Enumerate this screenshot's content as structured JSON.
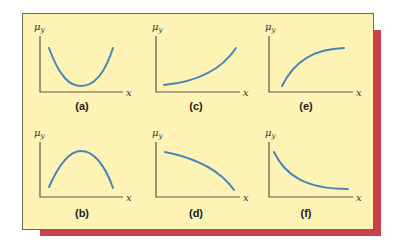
{
  "figure": {
    "panels": [
      {
        "id": "a",
        "label": "(a)",
        "shape": "U-shaped (convex, minimum in middle)",
        "y_label": "μ",
        "y_sub": "y",
        "x_label": "x"
      },
      {
        "id": "b",
        "label": "(b)",
        "shape": "inverted U (concave, maximum in middle)",
        "y_label": "μ",
        "y_sub": "y",
        "x_label": "x"
      },
      {
        "id": "c",
        "label": "(c)",
        "shape": "increasing, convex",
        "y_label": "μ",
        "y_sub": "y",
        "x_label": "x"
      },
      {
        "id": "d",
        "label": "(d)",
        "shape": "decreasing, concave",
        "y_label": "μ",
        "y_sub": "y",
        "x_label": "x"
      },
      {
        "id": "e",
        "label": "(e)",
        "shape": "increasing, concave",
        "y_label": "μ",
        "y_sub": "y",
        "x_label": "x"
      },
      {
        "id": "f",
        "label": "(f)",
        "shape": "decreasing, convex",
        "y_label": "μ",
        "y_sub": "y",
        "x_label": "x"
      }
    ],
    "colors": {
      "background": "#fdf3b4",
      "shadow": "#c8424e",
      "curve": "#4a86b4",
      "axis": "#5a5a4a"
    }
  }
}
